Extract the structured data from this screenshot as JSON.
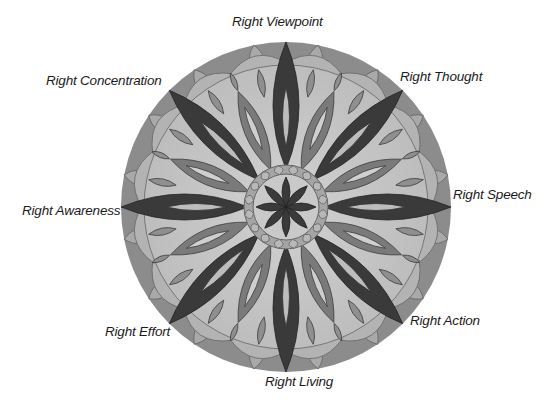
{
  "diagram": {
    "type": "mandala",
    "center_label": "",
    "labels": [
      {
        "id": "viewpoint",
        "text": "Right Viewpoint"
      },
      {
        "id": "thought",
        "text": "Right Thought"
      },
      {
        "id": "speech",
        "text": "Right Speech"
      },
      {
        "id": "action",
        "text": "Right Action"
      },
      {
        "id": "living",
        "text": "Right Living"
      },
      {
        "id": "effort",
        "text": "Right Effort"
      },
      {
        "id": "awareness",
        "text": "Right Awareness"
      },
      {
        "id": "concentration",
        "text": "Right Concentration"
      }
    ],
    "colors": {
      "outer_band": "#8a8a8a",
      "scallop": "#a9a9a9",
      "field": "#c8c8c8",
      "big_petal": "#3a3a3a",
      "mid_petal": "#7a7a7a",
      "small_petal": "#8f8f8f",
      "center_ring": "#a0a0a0"
    }
  }
}
